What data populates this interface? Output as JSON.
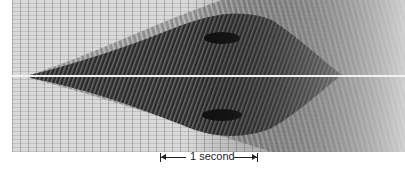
{
  "figure": {
    "colors": {
      "background": "#d9d9d9",
      "ink": "#1a1a1a",
      "center_line": "#f2f2f2"
    }
  },
  "scale_bar": {
    "label": "1 second",
    "left_arrow_icon": "left-arrow-bar",
    "right_arrow_icon": "right-arrow-bar"
  }
}
